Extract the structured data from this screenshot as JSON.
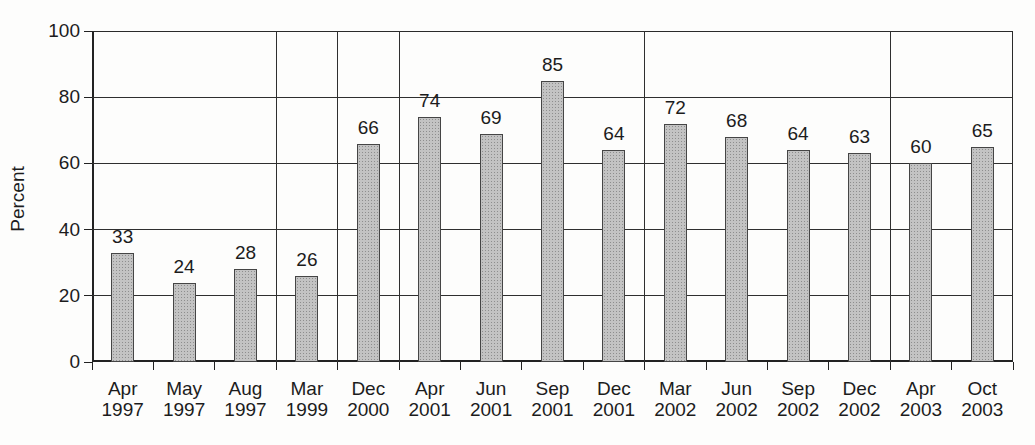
{
  "figure": {
    "kind": "scanned statistical bar chart",
    "background_color": "#fdfdfc"
  },
  "chart_data": {
    "type": "bar",
    "title": "",
    "xlabel": "",
    "ylabel": "Percent",
    "ylim": [
      0,
      100
    ],
    "yticks": [
      0,
      20,
      40,
      60,
      80,
      100
    ],
    "grid": true,
    "legend": "none",
    "bar_value_labels_shown": true,
    "categories": [
      "Apr 1997",
      "May 1997",
      "Aug 1997",
      "Mar 1999",
      "Dec 2000",
      "Apr 2001",
      "Jun 2001",
      "Sep 2001",
      "Dec 2001",
      "Mar 2002",
      "Jun 2002",
      "Sep 2002",
      "Dec 2002",
      "Apr 2003",
      "Oct 2003"
    ],
    "values": [
      33,
      24,
      28,
      26,
      66,
      74,
      69,
      85,
      64,
      72,
      68,
      64,
      63,
      60,
      65
    ],
    "group_dividers_before_index": [
      3,
      4,
      5,
      9,
      13
    ],
    "colors": {
      "bar_fill": "#c3c3c3",
      "bar_dot": "#8e8e8e",
      "bar_border": "#454545",
      "line": "#2f2f2f",
      "axis": "#222222",
      "text": "#1c1c1c"
    }
  }
}
